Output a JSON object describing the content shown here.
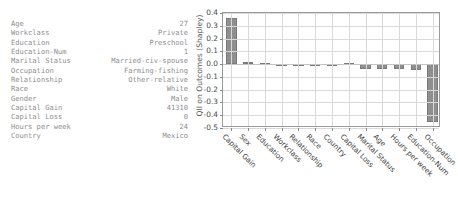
{
  "feature_table": {
    "rows": [
      {
        "key": "Age",
        "value": "27"
      },
      {
        "key": "Workclass",
        "value": "Private"
      },
      {
        "key": "Education",
        "value": "Preschool"
      },
      {
        "key": "Education-Num",
        "value": "1"
      },
      {
        "key": "Marital Status",
        "value": "Married-civ-spouse"
      },
      {
        "key": "Occupation",
        "value": "Farming-fishing"
      },
      {
        "key": "Relationship",
        "value": "Other-relative"
      },
      {
        "key": "Race",
        "value": "White"
      },
      {
        "key": "Gender",
        "value": "Male"
      },
      {
        "key": "Capital Gain",
        "value": "41310"
      },
      {
        "key": "Capital Loss",
        "value": "0"
      },
      {
        "key": "Hours per week",
        "value": "24"
      },
      {
        "key": "Country",
        "value": "Mexico"
      }
    ]
  },
  "chart_data": {
    "type": "bar",
    "title": "",
    "xlabel": "",
    "ylabel": "QII on Outcomes (Shapley)",
    "ylim": [
      -0.5,
      0.4
    ],
    "yticks": [
      0.4,
      0.3,
      0.2,
      0.1,
      0.0,
      -0.1,
      -0.2,
      -0.3,
      -0.4,
      -0.5
    ],
    "ytick_labels": [
      "0.4",
      "0.3",
      "0.2",
      "0.1",
      "0.0",
      "-0.1",
      "-0.2",
      "-0.3",
      "-0.4",
      "-0.5"
    ],
    "grid": true,
    "legend": null,
    "bar_color": "#8f8f8f",
    "categories": [
      "Capital Gain",
      "Sex",
      "Education",
      "Workclass",
      "Relationship",
      "Race",
      "Country",
      "Capital Loss",
      "Marital Status",
      "Age",
      "Hours per week",
      "Education-Num",
      "Occupation"
    ],
    "values": [
      0.36,
      0.015,
      0.012,
      0.0,
      0.0,
      0.0,
      0.0,
      0.008,
      -0.035,
      -0.04,
      -0.04,
      -0.05,
      -0.45
    ]
  }
}
